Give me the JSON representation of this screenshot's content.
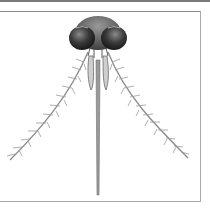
{
  "image": {
    "subject": "mosquito head illustration",
    "alt": "Illustration of a mosquito head with two large compound eyes, feathery antennae and a long proboscis",
    "colors": {
      "eye": "#2e2e2e",
      "head": "#555555",
      "limb": "#8a8a8a",
      "border": "#a8a8a8",
      "background": "#ffffff"
    }
  }
}
